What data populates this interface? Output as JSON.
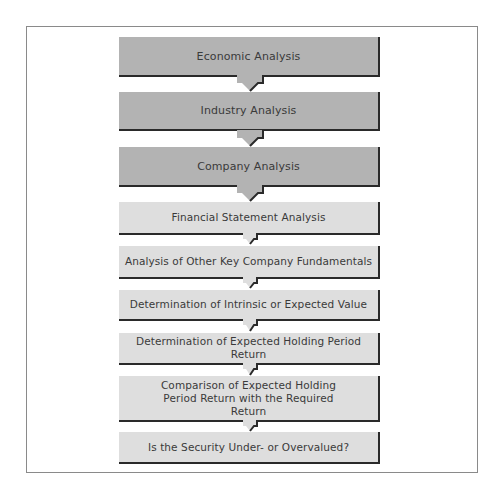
{
  "diagram": {
    "title": "",
    "type": "vertical-flowchart",
    "colors": {
      "primary_stage_fill": "#b3b3b3",
      "secondary_stage_fill": "#dedede",
      "shadow": "#2a2a2a",
      "text": "#3a3a3a",
      "frame_border": "#8a8a8a"
    },
    "steps": [
      {
        "label": "Economic Analysis",
        "style": "dark"
      },
      {
        "label": "Industry Analysis",
        "style": "dark"
      },
      {
        "label": "Company Analysis",
        "style": "dark"
      },
      {
        "label": "Financial Statement Analysis",
        "style": "light"
      },
      {
        "label": "Analysis of Other Key Company Fundamentals",
        "style": "light"
      },
      {
        "label": "Determination of Intrinsic or Expected Value",
        "style": "light"
      },
      {
        "label": "Determination of Expected Holding Period Return",
        "style": "light"
      },
      {
        "label": "Comparison of Expected Holding Period Return with the Required Return",
        "style": "light"
      },
      {
        "label": "Is the Security Under- or Overvalued?",
        "style": "light"
      }
    ],
    "connectors": [
      {
        "from": 0,
        "to": 1,
        "icon": "down-arrow-icon"
      },
      {
        "from": 1,
        "to": 2,
        "icon": "down-arrow-icon"
      },
      {
        "from": 2,
        "to": 3,
        "icon": "down-arrow-icon"
      },
      {
        "from": 3,
        "to": 4,
        "icon": "down-arrow-icon"
      },
      {
        "from": 4,
        "to": 5,
        "icon": "down-arrow-icon"
      },
      {
        "from": 5,
        "to": 6,
        "icon": "down-arrow-icon"
      },
      {
        "from": 6,
        "to": 7,
        "icon": "down-arrow-icon"
      },
      {
        "from": 7,
        "to": 8,
        "icon": "down-arrow-icon"
      }
    ]
  }
}
